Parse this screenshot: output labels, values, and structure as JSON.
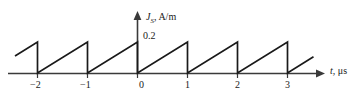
{
  "figure": {
    "background_color": "#ffffff",
    "line_color": "#1a1a1a",
    "axis_color": "#3a3a3a"
  },
  "yaxis": {
    "label_var": "J",
    "label_sub": "S",
    "label_unit": ", A/m",
    "label_full": "J_S, A/m",
    "peak_value_label": "0.2",
    "arrow_icon": "arrow-up-icon"
  },
  "xaxis": {
    "label_var": "t",
    "label_unit": ", μs",
    "label_full": "t, μs",
    "arrow_icon": "arrow-right-icon",
    "tick_labels": [
      "−2",
      "−1",
      "0",
      "1",
      "2",
      "3"
    ]
  },
  "chart_data": {
    "type": "line",
    "title": "",
    "subtitle": "",
    "xlabel": "t, μs",
    "ylabel": "J_S, A/m",
    "waveform": "sawtooth",
    "period": 1,
    "amplitude": 0.2,
    "xlim": [
      -2.45,
      3.55
    ],
    "ylim": [
      0,
      0.26
    ],
    "grid": false,
    "legend": null,
    "x_ticks": [
      -2,
      -1,
      0,
      1,
      2,
      3
    ],
    "x_tick_labels": [
      "−2",
      "−1",
      "0",
      "1",
      "2",
      "3"
    ],
    "y_ticks": [
      0.2
    ],
    "y_tick_labels": [
      "0.2"
    ],
    "x": [
      -2.45,
      -2.0,
      -2.0,
      -1.0,
      -1.0,
      0.0,
      0.0,
      1.0,
      1.0,
      2.0,
      2.0,
      3.0,
      3.0,
      3.52
    ],
    "y": [
      0.11,
      0.2,
      0.0,
      0.2,
      0.0,
      0.2,
      0.0,
      0.2,
      0.0,
      0.2,
      0.0,
      0.2,
      0.0,
      0.105
    ],
    "segments": [
      {
        "name": "partial-ramp-left",
        "x_start": -2.45,
        "x_end": -2.0,
        "y_start": 0.11,
        "y_end": 0.2
      },
      {
        "name": "drop-at--2",
        "x": -2.0,
        "y_from": 0.2,
        "y_to": 0.0
      },
      {
        "name": "ramp--2-to--1",
        "x_start": -2.0,
        "x_end": -1.0,
        "y_start": 0.0,
        "y_end": 0.2
      },
      {
        "name": "drop-at--1",
        "x": -1.0,
        "y_from": 0.2,
        "y_to": 0.0
      },
      {
        "name": "ramp--1-to-0",
        "x_start": -1.0,
        "x_end": 0.0,
        "y_start": 0.0,
        "y_end": 0.2
      },
      {
        "name": "drop-at-0",
        "x": 0.0,
        "y_from": 0.2,
        "y_to": 0.0
      },
      {
        "name": "ramp-0-to-1",
        "x_start": 0.0,
        "x_end": 1.0,
        "y_start": 0.0,
        "y_end": 0.2
      },
      {
        "name": "drop-at-1",
        "x": 1.0,
        "y_from": 0.2,
        "y_to": 0.0
      },
      {
        "name": "ramp-1-to-2",
        "x_start": 1.0,
        "x_end": 2.0,
        "y_start": 0.0,
        "y_end": 0.2
      },
      {
        "name": "drop-at-2",
        "x": 2.0,
        "y_from": 0.2,
        "y_to": 0.0
      },
      {
        "name": "ramp-2-to-3",
        "x_start": 2.0,
        "x_end": 3.0,
        "y_start": 0.0,
        "y_end": 0.2
      },
      {
        "name": "drop-at-3",
        "x": 3.0,
        "y_from": 0.2,
        "y_to": 0.0
      },
      {
        "name": "partial-ramp-right",
        "x_start": 3.0,
        "x_end": 3.52,
        "y_start": 0.0,
        "y_end": 0.105
      }
    ]
  }
}
